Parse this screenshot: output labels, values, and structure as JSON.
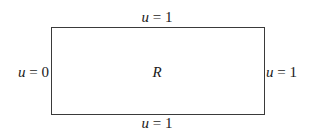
{
  "diagram": {
    "region_label": "R",
    "boundaries": {
      "top": {
        "var": "u",
        "eq": " = ",
        "value": "1"
      },
      "bottom": {
        "var": "u",
        "eq": " = ",
        "value": "1"
      },
      "left": {
        "var": "u",
        "eq": " = ",
        "value": "0"
      },
      "right": {
        "var": "u",
        "eq": " = ",
        "value": "1"
      }
    }
  }
}
